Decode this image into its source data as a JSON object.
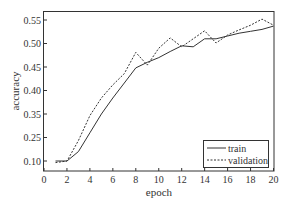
{
  "chart_data": {
    "type": "line",
    "title": "",
    "xlabel": "epoch",
    "ylabel": "accuracy",
    "xlim": [
      0,
      20
    ],
    "x_ticks": [
      "0",
      "2",
      "4",
      "6",
      "8",
      "10",
      "12",
      "14",
      "16",
      "18",
      "20"
    ],
    "y_ticks": [
      "0.10",
      "0.25",
      "0.35",
      "0.40",
      "0.45",
      "0.50",
      "0.55"
    ],
    "y_tick_note": "tick marks are evenly spaced although labels are not uniformly spaced",
    "grid": false,
    "legend_position": "lower right",
    "x": [
      1,
      2,
      3,
      4,
      5,
      6,
      7,
      8,
      9,
      10,
      11,
      12,
      13,
      14,
      15,
      16,
      17,
      18,
      19,
      20
    ],
    "series": [
      {
        "name": "train",
        "style": "solid",
        "color": "#333333",
        "values": [
          0.1,
          0.1,
          0.16,
          0.27,
          0.35,
          0.384,
          0.416,
          0.448,
          0.46,
          0.47,
          0.483,
          0.495,
          0.493,
          0.51,
          0.51,
          0.516,
          0.522,
          0.526,
          0.53,
          0.537
        ]
      },
      {
        "name": "validation",
        "style": "dashed",
        "color": "#333333",
        "values": [
          0.09,
          0.1,
          0.23,
          0.343,
          0.384,
          0.412,
          0.436,
          0.481,
          0.454,
          0.49,
          0.512,
          0.493,
          0.51,
          0.527,
          0.501,
          0.518,
          0.529,
          0.539,
          0.552,
          0.539
        ]
      }
    ]
  }
}
